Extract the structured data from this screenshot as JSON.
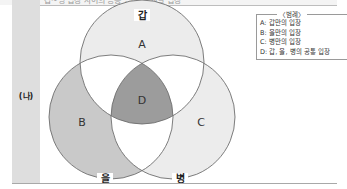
{
  "header": {
    "cut_off_text": "갑~병 입장 사이의 공통 입장 및 개별 입장"
  },
  "row_label": "(나)",
  "diagram": {
    "circles": [
      {
        "name": "갑",
        "cx": 142,
        "cy": 62,
        "r": 62
      },
      {
        "name": "을",
        "cx": 111,
        "cy": 117,
        "r": 62
      },
      {
        "name": "병",
        "cx": 173,
        "cy": 117,
        "r": 62
      }
    ],
    "regions": {
      "A": "A",
      "B": "B",
      "C": "C",
      "D": "D"
    },
    "colors": {
      "A_fill": "#ececec",
      "B_fill": "#c9c9c9",
      "C_fill": "#ececec",
      "D_fill": "#9c9c9c",
      "stroke": "#6e6e6e"
    }
  },
  "legend": {
    "title": "〈범례〉",
    "items": [
      {
        "text": "A: 갑만의 입장"
      },
      {
        "text": "B: 을만의 입장"
      },
      {
        "text": "C: 병만의 입장"
      },
      {
        "text": "D: 갑, 을, 병의 공통 입장"
      }
    ]
  }
}
